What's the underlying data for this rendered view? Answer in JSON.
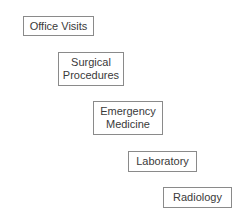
{
  "diagram": {
    "type": "staircase-list",
    "colors": {
      "background": "#ffffff",
      "border": "#8a8a8a",
      "text": "#3a3a3a"
    },
    "boxes": [
      {
        "label": "Office Visits"
      },
      {
        "label": "Surgical\nProcedures"
      },
      {
        "label": "Emergency\nMedicine"
      },
      {
        "label": "Laboratory"
      },
      {
        "label": "Radiology"
      }
    ]
  }
}
